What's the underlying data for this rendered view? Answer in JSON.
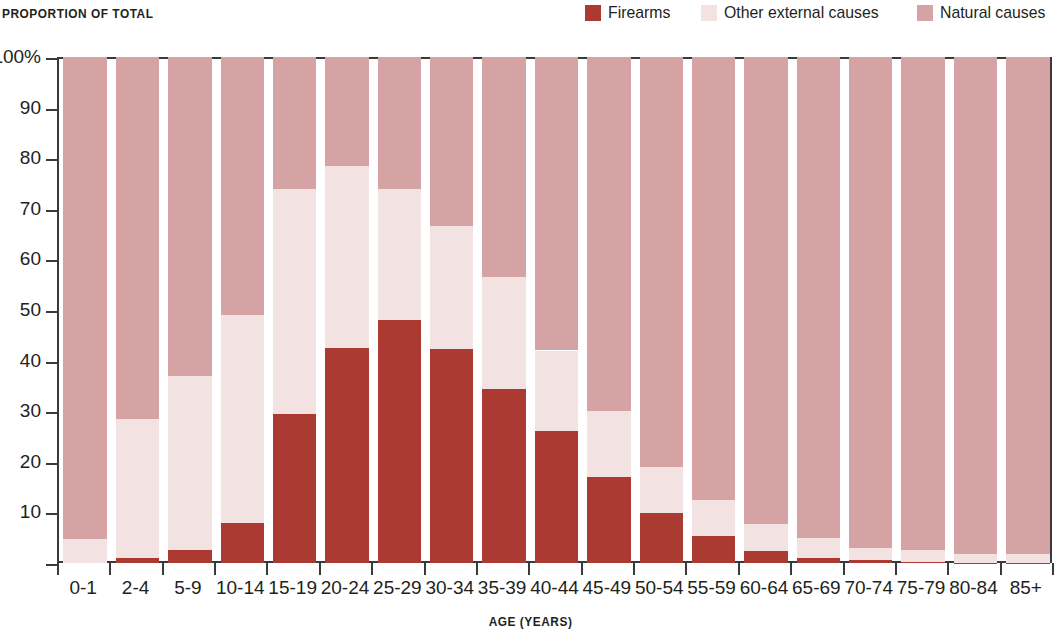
{
  "header": {
    "y_axis_title": "PROPORTION OF TOTAL",
    "x_axis_title": "AGE (YEARS)"
  },
  "legend": {
    "position": "top-right",
    "items": [
      {
        "label": "Firearms",
        "color": "#ab3a33",
        "swatch": "legend-swatch-firearms"
      },
      {
        "label": "Other external causes",
        "color": "#f2e3e2",
        "swatch": "legend-swatch-other"
      },
      {
        "label": "Natural causes",
        "color": "#d5a3a4",
        "swatch": "legend-swatch-natural"
      }
    ]
  },
  "axes": {
    "y_ticks": [
      "100%",
      "90",
      "80",
      "70",
      "60",
      "50",
      "40",
      "30",
      "20",
      "10"
    ],
    "y_tick_values": [
      100,
      90,
      80,
      70,
      60,
      50,
      40,
      30,
      20,
      10,
      0
    ],
    "y_min": 0,
    "y_max": 100
  },
  "chart_data": {
    "type": "bar",
    "subtype": "stacked-100-percent",
    "title": "",
    "subtitle": "",
    "xlabel": "AGE (YEARS)",
    "ylabel": "PROPORTION OF TOTAL",
    "ylim": [
      0,
      100
    ],
    "ytick_labels": [
      "100%",
      "90",
      "80",
      "70",
      "60",
      "50",
      "40",
      "30",
      "20",
      "10"
    ],
    "grid": false,
    "legend_position": "top-right",
    "categories": [
      "0-1",
      "2-4",
      "5-9",
      "10-14",
      "15-19",
      "20-24",
      "25-29",
      "30-34",
      "35-39",
      "40-44",
      "45-49",
      "50-54",
      "55-59",
      "60-64",
      "65-69",
      "70-74",
      "75-79",
      "80-84",
      "85+"
    ],
    "series": [
      {
        "name": "Firearms",
        "color": "#ab3a33",
        "values": [
          0,
          1.0,
          2.5,
          8.0,
          29.5,
          42.5,
          48.0,
          42.3,
          34.3,
          26.0,
          17.0,
          9.8,
          5.3,
          2.3,
          0.9,
          0.5,
          0.2,
          0.1,
          0.1
        ]
      },
      {
        "name": "Other external causes",
        "color": "#f2e3e2",
        "values": [
          4.8,
          27.5,
          34.5,
          41.0,
          44.5,
          36.0,
          26.0,
          24.3,
          22.2,
          16.0,
          13.0,
          9.2,
          7.2,
          5.4,
          4.1,
          2.4,
          2.3,
          1.7,
          1.6
        ]
      },
      {
        "name": "Natural causes",
        "color": "#d5a3a4",
        "values": [
          95.2,
          71.5,
          63.0,
          51.0,
          26.0,
          21.5,
          26.0,
          33.4,
          43.5,
          58.0,
          70.0,
          81.0,
          87.5,
          92.3,
          95.0,
          97.1,
          97.5,
          98.2,
          98.3
        ]
      }
    ]
  }
}
